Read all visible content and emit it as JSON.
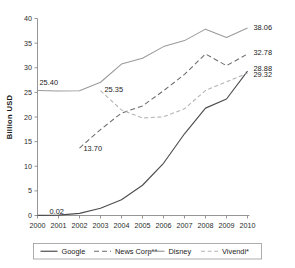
{
  "chart_data": {
    "type": "line",
    "title": "",
    "xlabel": "",
    "ylabel": "Billion USD",
    "grid": false,
    "legend_position": "bottom",
    "x": [
      2000,
      2001,
      2002,
      2003,
      2004,
      2005,
      2006,
      2007,
      2008,
      2009,
      2010
    ],
    "xtick_labels": [
      "2000",
      "2001",
      "2002",
      "2003",
      "2004",
      "2005",
      "2006",
      "2007",
      "2008",
      "2009",
      "2010"
    ],
    "ytick_labels": [
      "0",
      "5",
      "10",
      "15",
      "20",
      "25",
      "30",
      "35",
      "40"
    ],
    "yticks": [
      0,
      5,
      10,
      15,
      20,
      25,
      30,
      35,
      40
    ],
    "ylim": [
      0,
      40
    ],
    "xlim": [
      2000,
      2010
    ],
    "series": [
      {
        "name": "Google",
        "style": "solid",
        "color": "#4d4d4d",
        "values": [
          0.02,
          0.09,
          0.44,
          1.47,
          3.19,
          6.14,
          10.6,
          16.59,
          21.8,
          23.65,
          29.32
        ]
      },
      {
        "name": "News Corp**",
        "style": "dashed",
        "color": "#6b6b6b",
        "values": [
          null,
          null,
          13.7,
          17.45,
          20.8,
          22.25,
          25.33,
          28.66,
          32.8,
          30.42,
          32.78
        ]
      },
      {
        "name": "Disney",
        "style": "solid",
        "color": "#9a9a9a",
        "values": [
          25.4,
          25.27,
          25.33,
          27.06,
          30.75,
          31.94,
          34.29,
          35.51,
          37.84,
          36.15,
          38.06
        ]
      },
      {
        "name": "Vivendi*",
        "style": "dashdot",
        "color": "#b3b3b3",
        "values": [
          null,
          null,
          null,
          25.35,
          21.43,
          19.8,
          20.04,
          21.66,
          25.39,
          27.13,
          28.88
        ]
      }
    ],
    "point_labels": [
      {
        "text": "25.40",
        "series": "Disney",
        "x": 2000,
        "y": 25.4,
        "anchor": "start",
        "dx": 2,
        "dy": -5
      },
      {
        "text": "0.02",
        "series": "Google",
        "x": 2000,
        "y": 0.02,
        "anchor": "start",
        "dx": 12,
        "dy": -1
      },
      {
        "text": "13.70",
        "series": "News Corp**",
        "x": 2002,
        "y": 13.7,
        "anchor": "start",
        "dx": 4,
        "dy": 3
      },
      {
        "text": "25.35",
        "series": "Vivendi*",
        "x": 2003,
        "y": 25.35,
        "anchor": "start",
        "dx": 4,
        "dy": 1
      },
      {
        "text": "38.06",
        "series": "Disney",
        "x": 2010,
        "y": 38.06,
        "anchor": "start",
        "dx": 6,
        "dy": 2
      },
      {
        "text": "32.78",
        "series": "News Corp**",
        "x": 2010,
        "y": 32.78,
        "anchor": "start",
        "dx": 6,
        "dy": 1
      },
      {
        "text": "28.88",
        "series": "Vivendi*",
        "x": 2010,
        "y": 28.88,
        "anchor": "start",
        "dx": 6,
        "dy": -2
      },
      {
        "text": "29.32",
        "series": "Google",
        "x": 2010,
        "y": 29.32,
        "anchor": "start",
        "dx": 6,
        "dy": 6
      }
    ],
    "legend": [
      {
        "label": "Google",
        "style": "solid",
        "color": "#4d4d4d"
      },
      {
        "label": "News Corp**",
        "style": "dashed",
        "color": "#6b6b6b"
      },
      {
        "label": "Disney",
        "style": "solid",
        "color": "#9a9a9a"
      },
      {
        "label": "Vivendi*",
        "style": "dashdot",
        "color": "#b3b3b3"
      }
    ]
  }
}
